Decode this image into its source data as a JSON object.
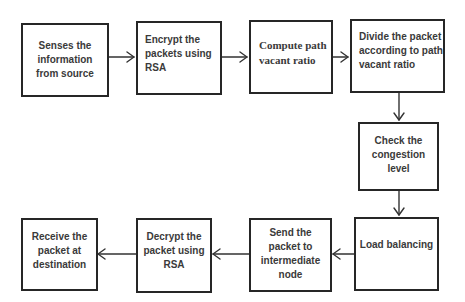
{
  "diagram": {
    "type": "flowchart",
    "nodes": [
      {
        "id": "b1",
        "label": "Senses the\ninformation\nfrom source"
      },
      {
        "id": "b2",
        "label": "Encrypt the\npackets using\nRSA"
      },
      {
        "id": "b3",
        "label": "Compute path\nvacant ratio"
      },
      {
        "id": "b4",
        "label": "Divide the packet\naccording to path\nvacant ratio"
      },
      {
        "id": "b5",
        "label": "Check the\ncongestion\nlevel"
      },
      {
        "id": "b6",
        "label": "Load balancing"
      },
      {
        "id": "b7",
        "label": "Send the\npacket to\nintermediate\nnode"
      },
      {
        "id": "b8",
        "label": "Decrypt the\npacket using\nRSA"
      },
      {
        "id": "b9",
        "label": "Receive the\npacket at\ndestination"
      }
    ],
    "edges": [
      {
        "from": "b1",
        "to": "b2"
      },
      {
        "from": "b2",
        "to": "b3"
      },
      {
        "from": "b3",
        "to": "b4"
      },
      {
        "from": "b4",
        "to": "b5"
      },
      {
        "from": "b5",
        "to": "b6"
      },
      {
        "from": "b6",
        "to": "b7"
      },
      {
        "from": "b7",
        "to": "b8"
      },
      {
        "from": "b8",
        "to": "b9"
      }
    ],
    "colors": {
      "stroke": "#262626",
      "text": "#3a3a3a",
      "background": "#ffffff"
    }
  }
}
